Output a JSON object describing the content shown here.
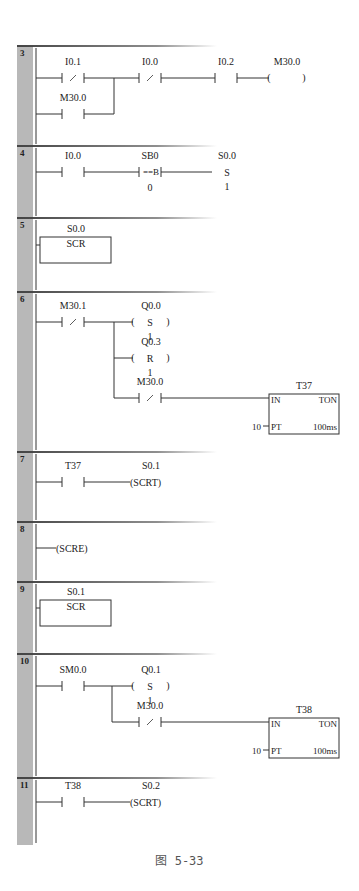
{
  "figure": {
    "caption": "图 5-33",
    "colors": {
      "gutter": "#b8b8b8",
      "line": "#333333",
      "separator": "#444444",
      "text": "#222222"
    }
  },
  "networks": [
    {
      "number": "3",
      "top": 46,
      "bottom": 146,
      "elements": [
        {
          "kind": "nc_contact",
          "label": "I0.1",
          "x": 62,
          "y": 78
        },
        {
          "kind": "no_contact",
          "label": "M30.0",
          "x": 62,
          "y": 114
        },
        {
          "kind": "nc_contact",
          "label": "I0.0",
          "x": 139,
          "y": 78
        },
        {
          "kind": "no_contact",
          "label": "I0.2",
          "x": 215,
          "y": 78
        },
        {
          "kind": "coil",
          "label": "M30.0",
          "symbol": "",
          "x": 286,
          "y": 78
        }
      ]
    },
    {
      "number": "4",
      "top": 146,
      "bottom": 218,
      "elements": [
        {
          "kind": "no_contact",
          "label": "I0.0",
          "x": 62,
          "y": 172
        },
        {
          "kind": "compare_contact",
          "label": "SB0",
          "op": "==B",
          "operand2": "0",
          "x": 139,
          "y": 172
        },
        {
          "kind": "set_text",
          "label": "S0.0",
          "symbol": "S",
          "count": "1",
          "x": 227,
          "y": 172
        }
      ]
    },
    {
      "number": "5",
      "top": 218,
      "bottom": 292,
      "elements": [
        {
          "kind": "scr_box",
          "label": "S0.0",
          "text": "SCR",
          "x": 40,
          "y": 237
        }
      ]
    },
    {
      "number": "6",
      "top": 292,
      "bottom": 452,
      "elements": [
        {
          "kind": "nc_contact",
          "label": "M30.1",
          "x": 62,
          "y": 322
        },
        {
          "kind": "coil",
          "label": "Q0.0",
          "symbol": "S",
          "count": "1",
          "x": 150,
          "y": 322
        },
        {
          "kind": "coil",
          "label": "Q0.3",
          "symbol": "R",
          "count": "1",
          "x": 150,
          "y": 358
        },
        {
          "kind": "nc_contact",
          "label": "M30.0",
          "x": 139,
          "y": 398
        },
        {
          "kind": "timer",
          "label": "T37",
          "type": "TON",
          "in": "IN",
          "pt": "PT",
          "preset": "10",
          "base": "100ms",
          "x": 269,
          "y": 394
        }
      ]
    },
    {
      "number": "7",
      "top": 452,
      "bottom": 522,
      "elements": [
        {
          "kind": "no_contact",
          "label": "T37",
          "x": 62,
          "y": 482
        },
        {
          "kind": "scrt_coil",
          "label": "S0.1",
          "text": "(SCRT)",
          "x": 130,
          "y": 482
        }
      ]
    },
    {
      "number": "8",
      "top": 522,
      "bottom": 582,
      "elements": [
        {
          "kind": "scre_coil",
          "text": "(SCRE)",
          "x": 56,
          "y": 548
        }
      ]
    },
    {
      "number": "9",
      "top": 582,
      "bottom": 654,
      "elements": [
        {
          "kind": "scr_box",
          "label": "S0.1",
          "text": "SCR",
          "x": 40,
          "y": 600
        }
      ]
    },
    {
      "number": "10",
      "top": 654,
      "bottom": 778,
      "elements": [
        {
          "kind": "no_contact",
          "label": "SM0.0",
          "x": 62,
          "y": 686
        },
        {
          "kind": "coil",
          "label": "Q0.1",
          "symbol": "S",
          "count": "1",
          "x": 150,
          "y": 686
        },
        {
          "kind": "nc_contact",
          "label": "M30.0",
          "x": 139,
          "y": 722
        },
        {
          "kind": "timer",
          "label": "T38",
          "type": "TON",
          "in": "IN",
          "pt": "PT",
          "preset": "10",
          "base": "100ms",
          "x": 269,
          "y": 718
        }
      ]
    },
    {
      "number": "11",
      "top": 778,
      "bottom": 845,
      "elements": [
        {
          "kind": "no_contact",
          "label": "T38",
          "x": 62,
          "y": 802
        },
        {
          "kind": "scrt_coil",
          "label": "S0.2",
          "text": "(SCRT)",
          "x": 130,
          "y": 802
        }
      ]
    }
  ]
}
